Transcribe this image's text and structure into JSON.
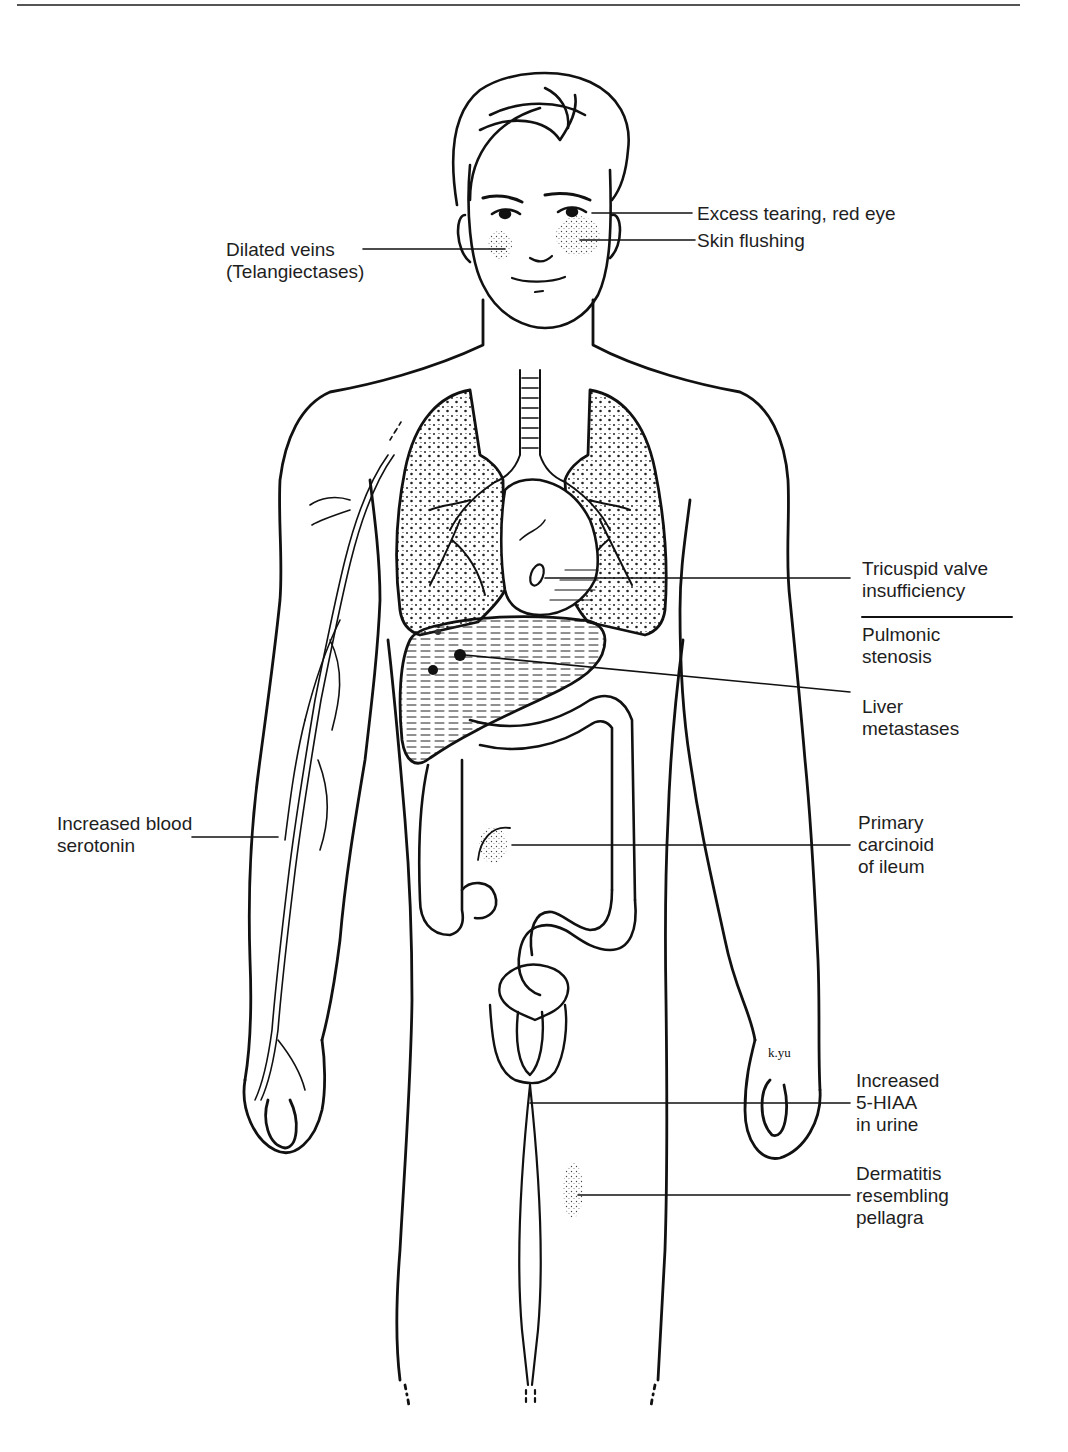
{
  "figure": {
    "type": "anatomical-diagram",
    "signature": "k.yu"
  },
  "labels": {
    "excess_tearing": {
      "lines": [
        "Excess tearing, red eye"
      ]
    },
    "skin_flushing": {
      "lines": [
        "Skin flushing"
      ]
    },
    "dilated_veins": {
      "lines": [
        "Dilated veins",
        "(Telangiectases)"
      ]
    },
    "tricuspid": {
      "lines": [
        "Tricuspid valve",
        "insufficiency"
      ]
    },
    "pulmonic": {
      "lines": [
        "Pulmonic",
        "stenosis"
      ]
    },
    "liver": {
      "lines": [
        "Liver",
        "metastases"
      ]
    },
    "blood_serotonin": {
      "lines": [
        "Increased blood",
        "serotonin"
      ]
    },
    "carcinoid_ileum": {
      "lines": [
        "Primary",
        "carcinoid",
        "of ileum"
      ]
    },
    "hiaa_urine": {
      "lines": [
        "Increased",
        "5-HIAA",
        "in urine"
      ]
    },
    "dermatitis": {
      "lines": [
        "Dermatitis",
        "resembling",
        "pellagra"
      ]
    }
  },
  "colors": {
    "ink": "#111111",
    "background": "#ffffff",
    "rule": "#555555"
  }
}
